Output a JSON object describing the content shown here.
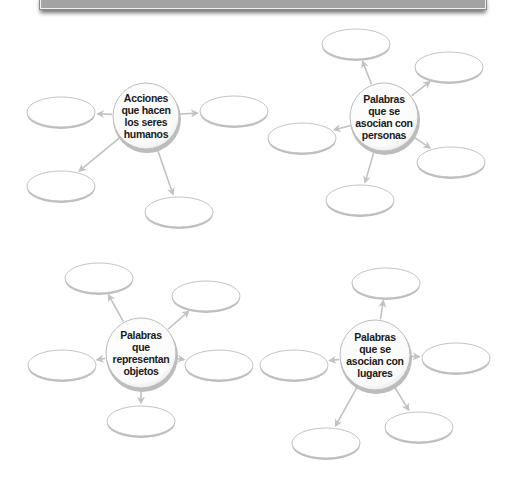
{
  "colors": {
    "header_fill": "#a3a3a3",
    "ellipse_stroke": "#c4c4c4",
    "ellipse_shadow": "#bdbdbd",
    "arrow": "#c2c2c2",
    "circle_stroke": "#bdbdbd",
    "text": "#1a1a1a"
  },
  "maps": [
    {
      "id": "acciones",
      "center_label": "Acciones\nque hacen\nlos seres\nhumanos",
      "center": {
        "cx": 146,
        "cy": 116,
        "r": 33
      },
      "slots": [
        {
          "cx": 61,
          "cy": 112,
          "answer": ""
        },
        {
          "cx": 234,
          "cy": 111,
          "answer": ""
        },
        {
          "cx": 61,
          "cy": 186,
          "answer": ""
        },
        {
          "cx": 179,
          "cy": 212,
          "answer": ""
        }
      ]
    },
    {
      "id": "personas",
      "center_label": "Palabras\nque se\nasocian con\npersonas",
      "center": {
        "cx": 384,
        "cy": 117,
        "r": 34
      },
      "slots": [
        {
          "cx": 356,
          "cy": 44,
          "answer": ""
        },
        {
          "cx": 449,
          "cy": 67,
          "answer": ""
        },
        {
          "cx": 302,
          "cy": 138,
          "answer": ""
        },
        {
          "cx": 451,
          "cy": 162,
          "answer": ""
        },
        {
          "cx": 360,
          "cy": 200,
          "answer": ""
        }
      ]
    },
    {
      "id": "objetos",
      "center_label": "Palabras\nque\nrepresentan\nobjetos",
      "center": {
        "cx": 141,
        "cy": 353,
        "r": 35
      },
      "slots": [
        {
          "cx": 99,
          "cy": 278,
          "answer": ""
        },
        {
          "cx": 206,
          "cy": 296,
          "answer": ""
        },
        {
          "cx": 62,
          "cy": 365,
          "answer": ""
        },
        {
          "cx": 219,
          "cy": 365,
          "answer": ""
        },
        {
          "cx": 141,
          "cy": 421,
          "answer": ""
        }
      ]
    },
    {
      "id": "lugares",
      "center_label": "Palabras\nque se\nasocian con\nlugares",
      "center": {
        "cx": 375,
        "cy": 355,
        "r": 35
      },
      "slots": [
        {
          "cx": 386,
          "cy": 283,
          "answer": ""
        },
        {
          "cx": 294,
          "cy": 365,
          "answer": ""
        },
        {
          "cx": 456,
          "cy": 358,
          "answer": ""
        },
        {
          "cx": 326,
          "cy": 443,
          "answer": ""
        },
        {
          "cx": 419,
          "cy": 427,
          "answer": ""
        }
      ]
    }
  ]
}
